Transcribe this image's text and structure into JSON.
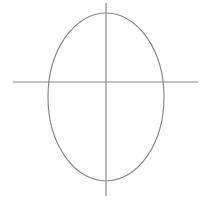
{
  "diagram": {
    "type": "ellipse-with-axes",
    "stroke_color": "#8a8a8a",
    "background": "#ffffff",
    "ellipse": {
      "cx": 106,
      "cy": 97,
      "rx": 58,
      "ry": 84
    },
    "horizontal_axis": {
      "x1": 13,
      "y1": 82,
      "x2": 198,
      "y2": 82
    },
    "vertical_axis": {
      "x1": 106,
      "y1": 3,
      "x2": 106,
      "y2": 196
    }
  }
}
